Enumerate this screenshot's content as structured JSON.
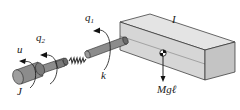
{
  "diagram": {
    "type": "flexible-joint single-link manipulator",
    "labels": {
      "u": "u",
      "q2": {
        "base": "q",
        "sub": "2"
      },
      "q1": {
        "base": "q",
        "sub": "1"
      },
      "k": "k",
      "J": "J",
      "I": "I",
      "Mgl": "Mgℓ"
    },
    "colors": {
      "body_fill": "#d6d6d6",
      "body_top": "#e4e4e4",
      "body_side": "#c4c4c4",
      "shaft_fill": "#8c8c8c",
      "shaft_dark": "#6a6a6a",
      "outline": "#2a2a2a",
      "text": "#1a1a1a"
    }
  }
}
